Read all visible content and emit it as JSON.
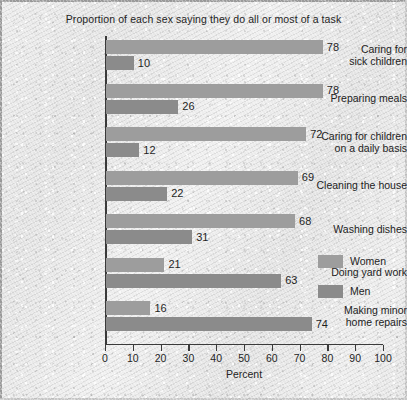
{
  "chart_data": {
    "type": "bar",
    "orientation": "horizontal",
    "title": "Proportion of each sex saying they do all or most of a task",
    "xlabel": "Percent",
    "ylabel": "",
    "xlim": [
      0,
      100
    ],
    "xticks": [
      0,
      10,
      20,
      30,
      40,
      50,
      60,
      70,
      80,
      90,
      100
    ],
    "grid": false,
    "legend_position": "right",
    "categories": [
      "Caring for sick children",
      "Preparing meals",
      "Caring for children on a daily basis",
      "Cleaning the house",
      "Washing dishes",
      "Doing yard work",
      "Making minor home repairs"
    ],
    "series": [
      {
        "name": "Women",
        "color": "#9d9d9d",
        "values": [
          78,
          78,
          72,
          69,
          68,
          21,
          16
        ]
      },
      {
        "name": "Men",
        "color": "#8b8b8b",
        "values": [
          10,
          26,
          12,
          22,
          31,
          63,
          74
        ]
      }
    ],
    "groups": [
      {
        "label_lines": [
          "Caring for",
          "sick children"
        ],
        "bars": [
          {
            "series": "Women",
            "value": 78,
            "label": "78"
          },
          {
            "series": "Men",
            "value": 10,
            "label": "10"
          }
        ]
      },
      {
        "label_lines": [
          "Preparing meals"
        ],
        "bars": [
          {
            "series": "Women",
            "value": 78,
            "label": "78"
          },
          {
            "series": "Men",
            "value": 26,
            "label": "26"
          }
        ]
      },
      {
        "label_lines": [
          "Caring for children",
          "on a daily basis"
        ],
        "bars": [
          {
            "series": "Women",
            "value": 72,
            "label": "72"
          },
          {
            "series": "Men",
            "value": 12,
            "label": "12"
          }
        ]
      },
      {
        "label_lines": [
          "Cleaning the house"
        ],
        "bars": [
          {
            "series": "Women",
            "value": 69,
            "label": "69"
          },
          {
            "series": "Men",
            "value": 22,
            "label": "22"
          }
        ]
      },
      {
        "label_lines": [
          "Washing dishes"
        ],
        "bars": [
          {
            "series": "Women",
            "value": 68,
            "label": "68"
          },
          {
            "series": "Men",
            "value": 31,
            "label": "31"
          }
        ]
      },
      {
        "label_lines": [
          "Doing yard work"
        ],
        "bars": [
          {
            "series": "Women",
            "value": 21,
            "label": "21"
          },
          {
            "series": "Men",
            "value": 63,
            "label": "63"
          }
        ]
      },
      {
        "label_lines": [
          "Making minor",
          "home repairs"
        ],
        "bars": [
          {
            "series": "Women",
            "value": 16,
            "label": "16"
          },
          {
            "series": "Men",
            "value": 74,
            "label": "74"
          }
        ]
      }
    ],
    "legend": [
      {
        "label": "Women",
        "color": "#9d9d9d"
      },
      {
        "label": "Men",
        "color": "#8b8b8b"
      }
    ]
  }
}
